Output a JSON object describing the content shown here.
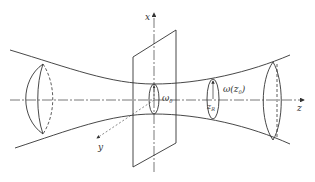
{
  "diagram": {
    "type": "gaussian-beam-propagation",
    "colors": {
      "stroke": "#333333",
      "axis": "#555555",
      "background": "#ffffff"
    },
    "labels": {
      "x_axis": "x",
      "y_axis": "y",
      "z_axis": "z",
      "waist": "ω",
      "waist_sub": "0",
      "beam_radius": "ω(z",
      "beam_radius_sub": "0",
      "beam_radius_close": ")",
      "rayleigh": "z",
      "rayleigh_sub": "R"
    }
  }
}
